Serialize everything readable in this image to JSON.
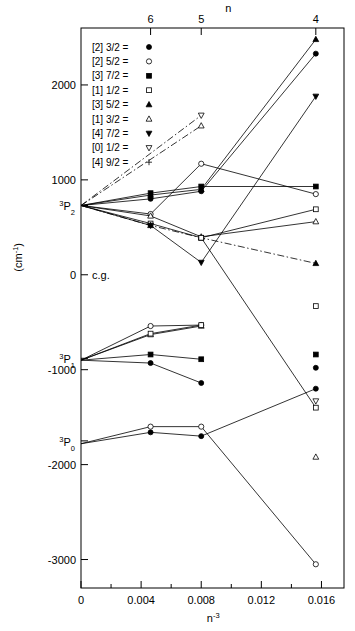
{
  "chart_data": {
    "type": "line",
    "title": "",
    "xlabel": "n-3",
    "ylabel": "(cm-1)",
    "top_axis_label": "n",
    "xlim": [
      0,
      0.0175
    ],
    "ylim": [
      -3300,
      2600
    ],
    "grid": false,
    "legend_position": "upper-left",
    "x_ticks": [
      {
        "value": 0,
        "label": "0"
      },
      {
        "value": 0.004,
        "label": "0.004"
      },
      {
        "value": 0.008,
        "label": "0.008"
      },
      {
        "value": 0.012,
        "label": "0.012"
      },
      {
        "value": 0.016,
        "label": "0.016"
      }
    ],
    "x_minor_ticks": [
      0.002,
      0.006,
      0.01,
      0.014
    ],
    "top_ticks": [
      {
        "value": 0.00463,
        "label": "6"
      },
      {
        "value": 0.008,
        "label": "5"
      },
      {
        "value": 0.015625,
        "label": "4"
      }
    ],
    "y_ticks": [
      {
        "value": 2000,
        "label": "2000"
      },
      {
        "value": 1000,
        "label": "1000"
      },
      {
        "value": 0,
        "label": "0"
      },
      {
        "value": -1000,
        "label": "-1000"
      },
      {
        "value": -2000,
        "label": "-2000"
      },
      {
        "value": -3000,
        "label": "-3000"
      }
    ],
    "y_annotations": [
      {
        "value": 0,
        "label": "c.g."
      },
      {
        "value": 730,
        "label": "3P2"
      },
      {
        "value": -880,
        "label": "3P1"
      },
      {
        "value": -1750,
        "label": "3P0"
      }
    ],
    "series": [
      {
        "name": "[2] 3/2",
        "marker": "filled-circle",
        "linestyle": "solid",
        "points": [
          {
            "x": 0.0,
            "y": 730
          },
          {
            "x": 0.00463,
            "y": 800
          },
          {
            "x": 0.008,
            "y": 880
          },
          {
            "x": 0.015625,
            "y": 2330
          }
        ]
      },
      {
        "name": "[2] 5/2",
        "marker": "open-circle",
        "linestyle": "solid",
        "points": [
          {
            "x": 0.0,
            "y": 730
          },
          {
            "x": 0.00463,
            "y": 640
          },
          {
            "x": 0.008,
            "y": 1170
          },
          {
            "x": 0.015625,
            "y": 850
          }
        ]
      },
      {
        "name": "[3] 7/2",
        "marker": "filled-square",
        "linestyle": "solid",
        "points": [
          {
            "x": 0.0,
            "y": 730
          },
          {
            "x": 0.00463,
            "y": 860
          },
          {
            "x": 0.008,
            "y": 930
          },
          {
            "x": 0.015625,
            "y": 930
          }
        ]
      },
      {
        "name": "[1] 1/2",
        "marker": "open-square",
        "linestyle": "solid",
        "points": [
          {
            "x": 0.0,
            "y": 730
          },
          {
            "x": 0.00463,
            "y": 540
          },
          {
            "x": 0.008,
            "y": 390
          },
          {
            "x": 0.015625,
            "y": 690
          }
        ]
      },
      {
        "name": "[3] 5/2",
        "marker": "filled-triangle-up",
        "linestyle": "solid",
        "points": [
          {
            "x": 0.0,
            "y": 730
          },
          {
            "x": 0.00463,
            "y": 840
          },
          {
            "x": 0.008,
            "y": 900
          },
          {
            "x": 0.015625,
            "y": 2480
          }
        ]
      },
      {
        "name": "[1] 3/2",
        "marker": "open-triangle-up",
        "linestyle": "solid",
        "points": [
          {
            "x": 0.0,
            "y": 730
          },
          {
            "x": 0.00463,
            "y": 620
          },
          {
            "x": 0.008,
            "y": 400
          },
          {
            "x": 0.015625,
            "y": 560
          }
        ]
      },
      {
        "name": "[4] 7/2",
        "marker": "filled-triangle-down",
        "linestyle": "solid",
        "points": [
          {
            "x": 0.0,
            "y": 730
          },
          {
            "x": 0.00463,
            "y": 520
          },
          {
            "x": 0.008,
            "y": 130
          },
          {
            "x": 0.015625,
            "y": 1880
          }
        ]
      },
      {
        "name": "[0] 1/2 upper",
        "marker": "open-triangle-down",
        "linestyle": "dashdot",
        "points": [
          {
            "x": 0.0,
            "y": 730
          },
          {
            "x": 0.008,
            "y": 1680
          }
        ]
      },
      {
        "name": "[4] 9/2 upper",
        "marker": "open-triangle-up",
        "linestyle": "dashdot",
        "points": [
          {
            "x": 0.0,
            "y": 730
          },
          {
            "x": 0.008,
            "y": 1570
          }
        ]
      },
      {
        "name": "[0] 1/2 descending",
        "marker": "filled-triangle-up",
        "linestyle": "dashdot",
        "points": [
          {
            "x": 0.0,
            "y": 730
          },
          {
            "x": 0.00463,
            "y": 520
          },
          {
            "x": 0.008,
            "y": 390
          },
          {
            "x": 0.015625,
            "y": 120
          }
        ]
      },
      {
        "name": "[2] 3/2 P1",
        "marker": "filled-circle",
        "linestyle": "solid",
        "points": [
          {
            "x": 0.0,
            "y": -900
          },
          {
            "x": 0.00463,
            "y": -930
          },
          {
            "x": 0.008,
            "y": -1140
          }
        ]
      },
      {
        "name": "[2] 5/2 P1",
        "marker": "open-circle",
        "linestyle": "solid",
        "points": [
          {
            "x": 0.0,
            "y": -900
          },
          {
            "x": 0.00463,
            "y": -540
          },
          {
            "x": 0.008,
            "y": -530
          }
        ]
      },
      {
        "name": "[3] 7/2 P1",
        "marker": "filled-square",
        "linestyle": "solid",
        "points": [
          {
            "x": 0.0,
            "y": -900
          },
          {
            "x": 0.00463,
            "y": -840
          },
          {
            "x": 0.008,
            "y": -890
          }
        ]
      },
      {
        "name": "[1] 3/2 P1",
        "marker": "open-triangle-up",
        "linestyle": "solid",
        "points": [
          {
            "x": 0.0,
            "y": -900
          },
          {
            "x": 0.00463,
            "y": -630
          },
          {
            "x": 0.008,
            "y": -540
          }
        ]
      },
      {
        "name": "[1] 1/2 P1",
        "marker": "open-square",
        "linestyle": "solid",
        "points": [
          {
            "x": 0.0,
            "y": -900
          },
          {
            "x": 0.00463,
            "y": -620
          },
          {
            "x": 0.008,
            "y": -530
          }
        ]
      },
      {
        "name": "[2] 3/2 P0",
        "marker": "filled-circle",
        "linestyle": "solid",
        "points": [
          {
            "x": 0.0,
            "y": -1780
          },
          {
            "x": 0.00463,
            "y": -1660
          },
          {
            "x": 0.008,
            "y": -1700
          },
          {
            "x": 0.015625,
            "y": -1200
          }
        ]
      },
      {
        "name": "[2] 5/2 P0",
        "marker": "open-circle",
        "linestyle": "solid",
        "points": [
          {
            "x": 0.0,
            "y": -1780
          },
          {
            "x": 0.00463,
            "y": -1600
          },
          {
            "x": 0.008,
            "y": -1600
          },
          {
            "x": 0.015625,
            "y": -3050
          }
        ]
      },
      {
        "name": "[1] 1/2 crossing",
        "marker": "open-square",
        "linestyle": "solid",
        "points": [
          {
            "x": 0.008,
            "y": 390
          },
          {
            "x": 0.015625,
            "y": -1400
          }
        ]
      }
    ],
    "isolated_points": [
      {
        "name": "[1] 1/2 n4",
        "marker": "open-square",
        "x": 0.015625,
        "y": -330
      },
      {
        "name": "[3] 7/2 n4",
        "marker": "filled-square",
        "x": 0.015625,
        "y": -840
      },
      {
        "name": "[2] 3/2 n4",
        "marker": "filled-circle",
        "x": 0.015625,
        "y": -980
      },
      {
        "name": "[0] 1/2 n4",
        "marker": "open-triangle-down",
        "x": 0.015625,
        "y": -1330
      },
      {
        "name": "[1] 3/2 n4",
        "marker": "open-triangle-up",
        "x": 0.015625,
        "y": -1920
      }
    ],
    "legend": [
      {
        "label": "[2] 3/2 =",
        "marker": "filled-circle"
      },
      {
        "label": "[2] 5/2 =",
        "marker": "open-circle"
      },
      {
        "label": "[3] 7/2 =",
        "marker": "filled-square"
      },
      {
        "label": "[1] 1/2 =",
        "marker": "open-square"
      },
      {
        "label": "[3] 5/2 =",
        "marker": "filled-triangle-up"
      },
      {
        "label": "[1] 3/2 =",
        "marker": "open-triangle-up"
      },
      {
        "label": "[4] 7/2 =",
        "marker": "filled-triangle-down"
      },
      {
        "label": "[0] 1/2 =",
        "marker": "open-triangle-down"
      },
      {
        "label": "[4] 9/2 =",
        "marker": "plus"
      }
    ]
  }
}
